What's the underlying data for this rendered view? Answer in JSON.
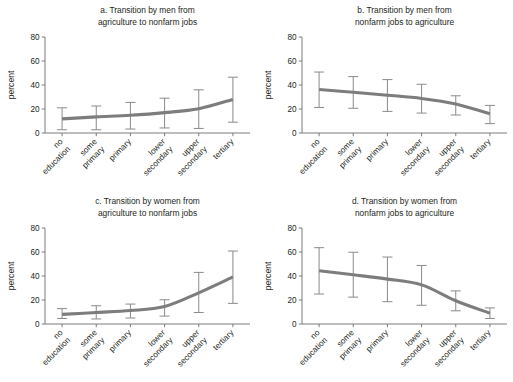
{
  "figure": {
    "axis_label": "percent",
    "categories": [
      "no education",
      "some primary",
      "primary",
      "lower secondary",
      "upper secondary",
      "tertiary"
    ],
    "category_lines": [
      [
        "no",
        "education"
      ],
      [
        "some",
        "primary"
      ],
      [
        "primary"
      ],
      [
        "lower",
        "secondary"
      ],
      [
        "upper",
        "secondary"
      ],
      [
        "tertiary"
      ]
    ],
    "y_ticks": [
      "0",
      "20",
      "40",
      "60",
      "80"
    ],
    "line_color": "#7d7d7d",
    "errorbar_color": "#8a8a8a",
    "axis_color": "#6e6e6e",
    "background_color": "#ffffff"
  },
  "chart_data": [
    {
      "type": "line",
      "panel": "a",
      "title_line1": "a. Transition by men from",
      "title_line2": "agriculture to nonfarm jobs",
      "xlabel": "",
      "ylabel": "percent",
      "ylim": [
        0,
        80
      ],
      "yticks": [
        0,
        20,
        40,
        60,
        80
      ],
      "grid": false,
      "legend": "none",
      "categories": [
        "no education",
        "some primary",
        "primary",
        "lower secondary",
        "upper secondary",
        "tertiary"
      ],
      "values": [
        11.8,
        13.4,
        14.8,
        17.0,
        20.2,
        28.0
      ],
      "error_low": [
        2.7,
        2.7,
        3.3,
        4.2,
        3.8,
        9.0
      ],
      "error_high": [
        21.0,
        22.5,
        25.5,
        29.0,
        36.0,
        46.5
      ]
    },
    {
      "type": "line",
      "panel": "b",
      "title_line1": "b. Transition by men from",
      "title_line2": "nonfarm jobs to agriculture",
      "xlabel": "",
      "ylabel": "percent",
      "ylim": [
        0,
        80
      ],
      "yticks": [
        0,
        20,
        40,
        60,
        80
      ],
      "grid": false,
      "legend": "none",
      "categories": [
        "no education",
        "some primary",
        "primary",
        "lower secondary",
        "upper secondary",
        "tertiary"
      ],
      "values": [
        36.2,
        34.0,
        31.5,
        28.8,
        24.2,
        16.0
      ],
      "error_low": [
        21.3,
        20.6,
        18.0,
        16.6,
        15.0,
        7.8
      ],
      "error_high": [
        50.8,
        47.0,
        44.5,
        40.6,
        31.0,
        23.0
      ]
    },
    {
      "type": "line",
      "panel": "c",
      "title_line1": "c. Transition by women from",
      "title_line2": "agriculture to nonfarm jobs",
      "xlabel": "",
      "ylabel": "percent",
      "ylim": [
        0,
        80
      ],
      "yticks": [
        0,
        20,
        40,
        60,
        80
      ],
      "grid": false,
      "legend": "none",
      "categories": [
        "no education",
        "some primary",
        "primary",
        "lower secondary",
        "upper secondary",
        "tertiary"
      ],
      "values": [
        8.0,
        9.6,
        11.2,
        14.6,
        26.0,
        39.2
      ],
      "error_low": [
        4.6,
        4.2,
        5.0,
        6.6,
        9.6,
        17.2
      ],
      "error_high": [
        12.8,
        15.2,
        16.6,
        20.2,
        43.0,
        60.8
      ]
    },
    {
      "type": "line",
      "panel": "d",
      "title_line1": "d. Transition by women from",
      "title_line2": "nonfarm jobs to agriculture",
      "xlabel": "",
      "ylabel": "percent",
      "ylim": [
        0,
        80
      ],
      "yticks": [
        0,
        20,
        40,
        60,
        80
      ],
      "grid": false,
      "legend": "none",
      "categories": [
        "no education",
        "some primary",
        "primary",
        "lower secondary",
        "upper secondary",
        "tertiary"
      ],
      "values": [
        44.4,
        41.0,
        37.4,
        32.6,
        19.4,
        9.0
      ],
      "error_low": [
        25.0,
        22.4,
        18.6,
        15.6,
        11.0,
        4.6
      ],
      "error_high": [
        63.6,
        59.8,
        55.8,
        48.8,
        27.6,
        13.4
      ]
    }
  ]
}
